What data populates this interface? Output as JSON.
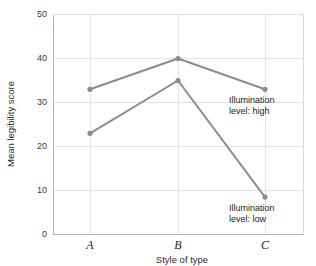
{
  "chart_data": {
    "type": "line",
    "title": "",
    "xlabel": "Style of type",
    "ylabel": "Mean legibility score",
    "categories": [
      "A",
      "B",
      "C"
    ],
    "x": [
      1,
      2,
      3
    ],
    "ylim": [
      0,
      50
    ],
    "yticks": [
      0,
      10,
      20,
      30,
      40,
      50
    ],
    "ytick_labels": [
      "0",
      "10",
      "20",
      "30",
      "40",
      "50"
    ],
    "grid": true,
    "legend_position": "inline-annotation",
    "series": [
      {
        "name": "Illumination level: high",
        "values": [
          33,
          40,
          33
        ],
        "color": "#8c8c8c"
      },
      {
        "name": "Illumination level: low",
        "values": [
          23,
          35,
          8.5
        ],
        "color": "#8c8c8c"
      }
    ],
    "annotations": [
      {
        "name": "illumination-high-label",
        "line1": "Illumination",
        "line2": "level: high",
        "at_x": 3,
        "at_y": 30
      },
      {
        "name": "illumination-low-label",
        "line1": "Illumination",
        "line2": "level: low",
        "at_x": 3,
        "at_y": 5
      }
    ]
  },
  "axes": {
    "y_ticks": {
      "t0": "0",
      "t1": "10",
      "t2": "20",
      "t3": "30",
      "t4": "40",
      "t5": "50"
    },
    "x_ticks": {
      "a": "A",
      "b": "B",
      "c": "C"
    },
    "x_title": "Style of type",
    "y_title": "Mean legibility score"
  },
  "annotations": {
    "high": {
      "line1": "Illumination",
      "line2": "level: high"
    },
    "low": {
      "line1": "Illumination",
      "line2": "level: low"
    }
  },
  "colors": {
    "series": "#8c8c8c",
    "grid": "#e2e2e2",
    "axis": "#b4b4b4",
    "text": "#1c1c1c",
    "background": "#ffffff"
  }
}
